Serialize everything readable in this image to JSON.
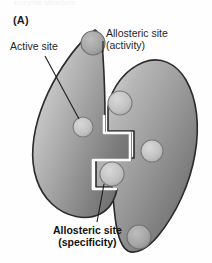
{
  "figure": {
    "panel_letter": "(A)",
    "top_cut_text": "enzyme structure",
    "labels": {
      "active_site": "Active site",
      "allosteric_activity_line1": "Allosteric site",
      "allosteric_activity_line2": "(activity)",
      "allosteric_specificity_line1": "Allosteric site",
      "allosteric_specificity_line2": "(specificity)"
    },
    "colors": {
      "background": "#fefefe",
      "protein_light": "#cfcfcf",
      "protein_mid": "#9a9a9a",
      "protein_dark": "#5e5e5e",
      "outline": "#2b2b2b",
      "site_fill": "#c4c4c4",
      "site_outline": "#6a6a6a",
      "leader_line": "#1c1c1c",
      "text": "#1c1c1c"
    },
    "sites": [
      {
        "name": "allosteric-site-activity",
        "x": 93,
        "y": 43,
        "r": 12
      },
      {
        "name": "allosteric-site-upper-right",
        "x": 120,
        "y": 103,
        "r": 12
      },
      {
        "name": "active-site",
        "x": 83,
        "y": 127,
        "r": 10
      },
      {
        "name": "allosteric-site-mid-right",
        "x": 152,
        "y": 151,
        "r": 11
      },
      {
        "name": "allosteric-site-specificity",
        "x": 112,
        "y": 174,
        "r": 12
      },
      {
        "name": "allosteric-site-bottom-right",
        "x": 139,
        "y": 237,
        "r": 12
      }
    ]
  }
}
